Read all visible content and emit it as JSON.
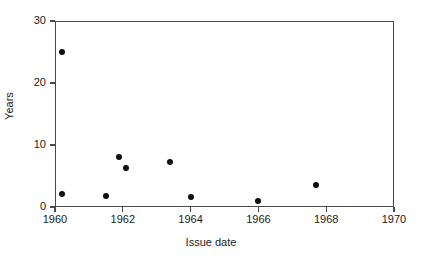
{
  "chart_data": {
    "type": "scatter",
    "title": "",
    "xlabel": "Issue date",
    "ylabel": "Years",
    "xlim": [
      1960,
      1970
    ],
    "ylim": [
      0,
      30
    ],
    "grid": false,
    "legend": null,
    "xticks": [
      1960,
      1962,
      1964,
      1966,
      1968,
      1970
    ],
    "xticklabels": [
      "1960",
      "1962",
      "1964",
      "1966",
      "1968",
      "1970"
    ],
    "yticks": [
      0,
      10,
      20,
      30
    ],
    "yticklabels": [
      "0",
      "10",
      "20",
      "30"
    ],
    "marker_color": "#0d0d0d",
    "marker_shape": "circle",
    "axis_color": "#4a4a4a",
    "points": [
      {
        "x": 1960.2,
        "y": 25.0
      },
      {
        "x": 1960.2,
        "y": 2.1
      },
      {
        "x": 1961.5,
        "y": 1.8
      },
      {
        "x": 1961.9,
        "y": 8.0
      },
      {
        "x": 1962.1,
        "y": 6.3
      },
      {
        "x": 1963.4,
        "y": 7.3
      },
      {
        "x": 1964.0,
        "y": 1.6
      },
      {
        "x": 1966.0,
        "y": 1.0
      },
      {
        "x": 1967.7,
        "y": 3.5
      }
    ]
  }
}
